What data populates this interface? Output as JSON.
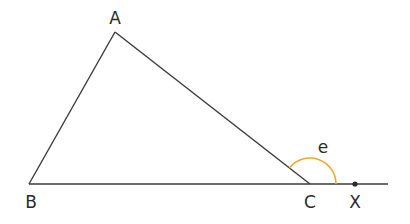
{
  "diagram": {
    "type": "geometry",
    "points": {
      "A": {
        "label": "A",
        "x": 115,
        "y": 32,
        "label_x": 115,
        "label_y": 24
      },
      "B": {
        "label": "B",
        "x": 29,
        "y": 184,
        "label_x": 31,
        "label_y": 208
      },
      "C": {
        "label": "C",
        "x": 310,
        "y": 184,
        "label_x": 310,
        "label_y": 208
      },
      "X": {
        "label": "X",
        "x": 355,
        "y": 184,
        "label_x": 355,
        "label_y": 208
      }
    },
    "line_end_x": 388,
    "angle": {
      "label": "e",
      "vertex": "C",
      "label_x": 323,
      "label_y": 153,
      "color": "#f0a830"
    },
    "colors": {
      "line": "#3a3a3a",
      "arc": "#f0a830",
      "text": "#2a2a2a"
    }
  }
}
